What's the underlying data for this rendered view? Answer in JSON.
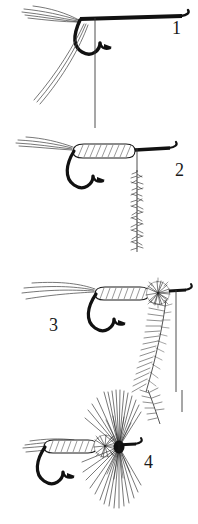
{
  "figure": {
    "background_color": "#ffffff",
    "ink_color": "#111111",
    "width": 198,
    "height": 524
  },
  "steps": [
    {
      "number": "1",
      "label_x": 172,
      "label_y": 34,
      "caption": "Hook with tail fibers tied in and thread hanging at bend",
      "elements": [
        "hook",
        "tail-fibers",
        "tinsel-strands",
        "thread",
        "bobbin-thread"
      ]
    },
    {
      "number": "2",
      "label_x": 175,
      "label_y": 176,
      "caption": "Quill body wrapped along shank; dubbing noodle spun on thread",
      "elements": [
        "hook",
        "tail-fibers",
        "quill-body",
        "thread",
        "dubbing-noodle"
      ]
    },
    {
      "number": "3",
      "label_x": 49,
      "label_y": 331,
      "caption": "Dubbing ball formed at head; hackle feather tied in",
      "elements": [
        "hook",
        "tail-fibers",
        "quill-body",
        "dubbing-ball",
        "hackle-feather",
        "thread"
      ]
    },
    {
      "number": "4",
      "label_x": 144,
      "label_y": 468,
      "caption": "Hackle wound as collar in front of dubbing ball; fly complete",
      "elements": [
        "hook",
        "tail-fibers",
        "quill-body",
        "dubbing-ball",
        "hackle-collar",
        "hackle-tip"
      ]
    }
  ],
  "colors": {
    "ink": "#111111",
    "thread": "#3a3a3a",
    "fiber": "#4a4a4a",
    "hatch": "#555555",
    "paper": "#ffffff"
  }
}
